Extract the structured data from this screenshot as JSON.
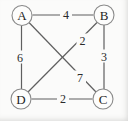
{
  "diagram": {
    "type": "weighted-undirected-graph",
    "colors": {
      "background": "#fbfbfa",
      "edge": "#5f5f5f",
      "node_stroke": "#8a8a8a",
      "text": "#1f1f1f"
    },
    "nodes": [
      {
        "id": "A",
        "label": "A"
      },
      {
        "id": "B",
        "label": "B"
      },
      {
        "id": "D",
        "label": "D"
      },
      {
        "id": "C",
        "label": "C"
      }
    ],
    "edges": [
      {
        "from": "A",
        "to": "B",
        "weight": "4"
      },
      {
        "from": "A",
        "to": "D",
        "weight": "6"
      },
      {
        "from": "B",
        "to": "C",
        "weight": "3"
      },
      {
        "from": "D",
        "to": "C",
        "weight": "2"
      },
      {
        "from": "D",
        "to": "B",
        "weight": "2"
      },
      {
        "from": "A",
        "to": "C",
        "weight": "7"
      }
    ]
  }
}
